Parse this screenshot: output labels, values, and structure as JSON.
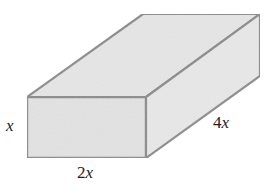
{
  "figure": {
    "type": "rectangular-prism",
    "colors": {
      "background": "#ffffff",
      "face_fill": "#e3e3e3",
      "top_fill": "#e6e6e6",
      "side_fill": "#e8e8e8",
      "stroke": "#8c8c8c",
      "label_text": "#222222"
    },
    "vertices": {
      "front_top_left": [
        27,
        97
      ],
      "front_top_right": [
        146,
        97
      ],
      "front_bottom_left": [
        27,
        158
      ],
      "front_bottom_right": [
        146,
        158
      ],
      "back_top_left": [
        143,
        14
      ],
      "back_top_right": [
        260,
        14
      ],
      "back_bottom_right": [
        260,
        76
      ]
    },
    "labels": {
      "height": {
        "coef": "",
        "var": "x",
        "full": "x"
      },
      "width": {
        "coef": "2",
        "var": "x",
        "full": "2x"
      },
      "depth": {
        "coef": "4",
        "var": "x",
        "full": "4x"
      }
    }
  }
}
